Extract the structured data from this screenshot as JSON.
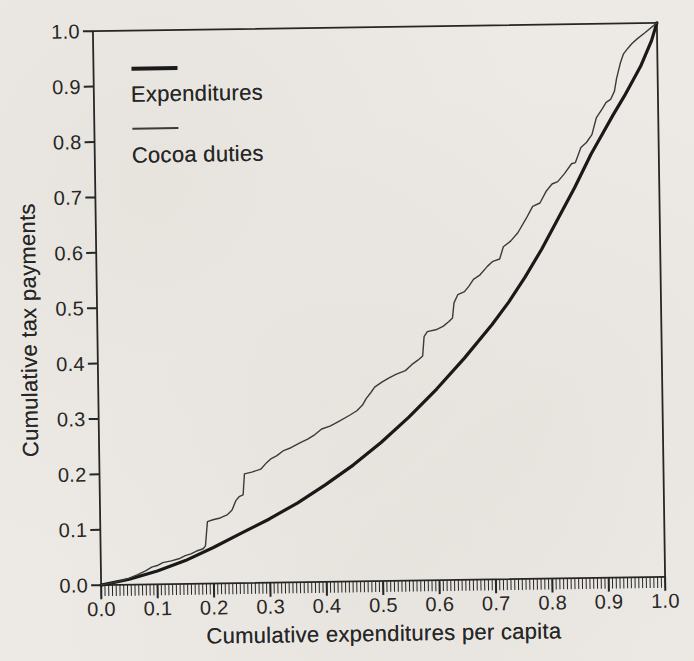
{
  "figure": {
    "paper_color": "#edeae5",
    "ink_color": "#262626",
    "thick_line_color": "#191919",
    "thin_line_color": "#3a3a3a"
  },
  "chart_data": {
    "type": "line",
    "title": "",
    "xlabel": "Cumulative expenditures per capita",
    "ylabel": "Cumulative tax payments",
    "xlim": [
      0,
      1
    ],
    "ylim": [
      0,
      1
    ],
    "grid": false,
    "legend_position": "upper-left-inside",
    "x_ticks": [
      0,
      0.1,
      0.2,
      0.3,
      0.4,
      0.5,
      0.6,
      0.7,
      0.8,
      0.9,
      1.0
    ],
    "x_tick_labels": [
      "0.0",
      "0.1",
      "0.2",
      "0.3",
      "0.4",
      "0.5",
      "0.6",
      "0.7",
      "0.8",
      "0.9",
      "1.0"
    ],
    "x_minor_ticks_per_axis": 150,
    "y_ticks": [
      0,
      0.1,
      0.2,
      0.3,
      0.4,
      0.5,
      0.6,
      0.7,
      0.8,
      0.9,
      1.0
    ],
    "y_tick_labels": [
      "0.0",
      "0.1",
      "0.2",
      "0.3",
      "0.4",
      "0.5",
      "0.6",
      "0.7",
      "0.8",
      "0.9",
      "1.0"
    ],
    "series": [
      {
        "name": "Expenditures",
        "line_weight": "thick",
        "color": "#191919",
        "stroke_width": 3.2,
        "points": [
          [
            0,
            0
          ],
          [
            0.05,
            0.01
          ],
          [
            0.1,
            0.024
          ],
          [
            0.15,
            0.042
          ],
          [
            0.2,
            0.065
          ],
          [
            0.25,
            0.09
          ],
          [
            0.3,
            0.115
          ],
          [
            0.35,
            0.143
          ],
          [
            0.4,
            0.175
          ],
          [
            0.45,
            0.21
          ],
          [
            0.5,
            0.25
          ],
          [
            0.55,
            0.295
          ],
          [
            0.6,
            0.345
          ],
          [
            0.65,
            0.4
          ],
          [
            0.7,
            0.46
          ],
          [
            0.73,
            0.5
          ],
          [
            0.76,
            0.545
          ],
          [
            0.79,
            0.595
          ],
          [
            0.82,
            0.65
          ],
          [
            0.85,
            0.705
          ],
          [
            0.88,
            0.765
          ],
          [
            0.9,
            0.8
          ],
          [
            0.92,
            0.835
          ],
          [
            0.94,
            0.868
          ],
          [
            0.955,
            0.895
          ],
          [
            0.97,
            0.922
          ],
          [
            0.98,
            0.945
          ],
          [
            0.99,
            0.968
          ],
          [
            1,
            1
          ]
        ]
      },
      {
        "name": "Cocoa duties",
        "line_weight": "thin",
        "color": "#3a3a3a",
        "stroke_width": 1.4,
        "points": [
          [
            0,
            0
          ],
          [
            0.03,
            0.006
          ],
          [
            0.05,
            0.012
          ],
          [
            0.065,
            0.018
          ],
          [
            0.08,
            0.025
          ],
          [
            0.09,
            0.031
          ],
          [
            0.1,
            0.034
          ],
          [
            0.11,
            0.039
          ],
          [
            0.125,
            0.042
          ],
          [
            0.14,
            0.046
          ],
          [
            0.15,
            0.051
          ],
          [
            0.16,
            0.054
          ],
          [
            0.17,
            0.059
          ],
          [
            0.182,
            0.063
          ],
          [
            0.186,
            0.068
          ],
          [
            0.19,
            0.112
          ],
          [
            0.2,
            0.115
          ],
          [
            0.213,
            0.118
          ],
          [
            0.226,
            0.124
          ],
          [
            0.234,
            0.132
          ],
          [
            0.241,
            0.149
          ],
          [
            0.247,
            0.156
          ],
          [
            0.254,
            0.159
          ],
          [
            0.257,
            0.197
          ],
          [
            0.27,
            0.2
          ],
          [
            0.286,
            0.205
          ],
          [
            0.295,
            0.215
          ],
          [
            0.305,
            0.224
          ],
          [
            0.315,
            0.229
          ],
          [
            0.327,
            0.238
          ],
          [
            0.34,
            0.243
          ],
          [
            0.357,
            0.252
          ],
          [
            0.37,
            0.258
          ],
          [
            0.383,
            0.266
          ],
          [
            0.395,
            0.276
          ],
          [
            0.41,
            0.281
          ],
          [
            0.425,
            0.289
          ],
          [
            0.445,
            0.3
          ],
          [
            0.458,
            0.308
          ],
          [
            0.468,
            0.318
          ],
          [
            0.475,
            0.33
          ],
          [
            0.483,
            0.34
          ],
          [
            0.49,
            0.35
          ],
          [
            0.503,
            0.359
          ],
          [
            0.515,
            0.366
          ],
          [
            0.529,
            0.373
          ],
          [
            0.545,
            0.379
          ],
          [
            0.557,
            0.39
          ],
          [
            0.568,
            0.398
          ],
          [
            0.576,
            0.405
          ],
          [
            0.579,
            0.44
          ],
          [
            0.585,
            0.449
          ],
          [
            0.6,
            0.452
          ],
          [
            0.613,
            0.458
          ],
          [
            0.623,
            0.466
          ],
          [
            0.63,
            0.473
          ],
          [
            0.633,
            0.5
          ],
          [
            0.64,
            0.515
          ],
          [
            0.652,
            0.52
          ],
          [
            0.66,
            0.53
          ],
          [
            0.668,
            0.542
          ],
          [
            0.68,
            0.55
          ],
          [
            0.693,
            0.565
          ],
          [
            0.703,
            0.574
          ],
          [
            0.715,
            0.578
          ],
          [
            0.722,
            0.6
          ],
          [
            0.735,
            0.61
          ],
          [
            0.748,
            0.625
          ],
          [
            0.763,
            0.65
          ],
          [
            0.775,
            0.672
          ],
          [
            0.788,
            0.678
          ],
          [
            0.8,
            0.7
          ],
          [
            0.81,
            0.712
          ],
          [
            0.82,
            0.716
          ],
          [
            0.832,
            0.73
          ],
          [
            0.845,
            0.748
          ],
          [
            0.852,
            0.75
          ],
          [
            0.862,
            0.777
          ],
          [
            0.872,
            0.786
          ],
          [
            0.882,
            0.8
          ],
          [
            0.89,
            0.83
          ],
          [
            0.9,
            0.845
          ],
          [
            0.908,
            0.858
          ],
          [
            0.916,
            0.863
          ],
          [
            0.923,
            0.878
          ],
          [
            0.927,
            0.9
          ],
          [
            0.934,
            0.928
          ],
          [
            0.94,
            0.945
          ],
          [
            0.948,
            0.955
          ],
          [
            0.955,
            0.963
          ],
          [
            0.965,
            0.972
          ],
          [
            0.978,
            0.982
          ],
          [
            1,
            1
          ]
        ]
      }
    ]
  },
  "legend": {
    "items": [
      {
        "label": "Expenditures"
      },
      {
        "label": "Cocoa duties"
      }
    ]
  }
}
